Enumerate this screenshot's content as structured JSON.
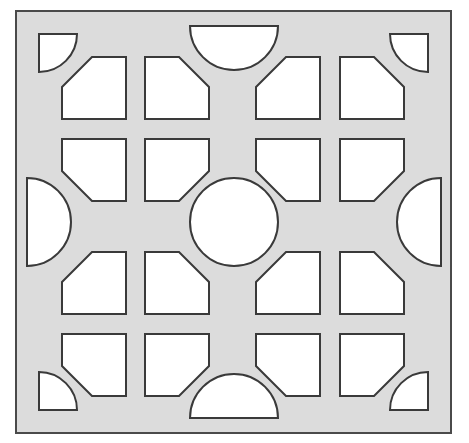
{
  "figure": {
    "name": "decorative-breeze-block-tile",
    "canvas": {
      "width": 469,
      "height": 443
    },
    "colors": {
      "page_background": "#ffffff",
      "tile_fill": "#dcdcdc",
      "opening_fill": "#ffffff",
      "outline": "#3a3a3a",
      "outer_border": "#4a4a4a"
    },
    "stroke_widths": {
      "outer_border": 2.0,
      "opening_outline": 2.0
    }
  },
  "frame": {
    "name": "outer-square-frame",
    "x": 16,
    "y": 11,
    "width": 435,
    "height": 422
  },
  "geometry": {
    "grid": {
      "rows": 4,
      "columns": 4,
      "cell_width": 64,
      "cell_height": 62,
      "corner_cut": 30,
      "columns_x": [
        62,
        145,
        256,
        340
      ],
      "rows_y": [
        57,
        139,
        252,
        334
      ]
    },
    "center_circle": {
      "name": "center-circle-opening",
      "cx": 234,
      "cy": 222,
      "r": 44
    },
    "corner_quarter_circles": [
      {
        "name": "corner-quarter-circle-top-left",
        "cx": 39,
        "cy": 34,
        "r": 38,
        "start_angle": 0,
        "end_angle": 90
      },
      {
        "name": "corner-quarter-circle-top-right",
        "cx": 428,
        "cy": 34,
        "r": 38,
        "start_angle": 90,
        "end_angle": 180
      },
      {
        "name": "corner-quarter-circle-bottom-right",
        "cx": 428,
        "cy": 410,
        "r": 38,
        "start_angle": 180,
        "end_angle": 270
      },
      {
        "name": "corner-quarter-circle-bottom-left",
        "cx": 39,
        "cy": 410,
        "r": 38,
        "start_angle": 270,
        "end_angle": 360
      }
    ],
    "edge_half_circles": [
      {
        "name": "edge-half-circle-top",
        "cx": 234,
        "cy": 26,
        "r": 44,
        "flat_side": "top"
      },
      {
        "name": "edge-half-circle-right",
        "cx": 441,
        "cy": 222,
        "r": 44,
        "flat_side": "right"
      },
      {
        "name": "edge-half-circle-bottom",
        "cx": 234,
        "cy": 418,
        "r": 44,
        "flat_side": "bottom"
      },
      {
        "name": "edge-half-circle-left",
        "cx": 27,
        "cy": 222,
        "r": 44,
        "flat_side": "left"
      }
    ],
    "pentagon_openings": [
      {
        "name": "pentagon-r1c1",
        "row": 1,
        "col": 1,
        "x": 62,
        "y": 57,
        "w": 64,
        "h": 62,
        "cut_corner": "top-left"
      },
      {
        "name": "pentagon-r1c2",
        "row": 1,
        "col": 2,
        "x": 145,
        "y": 57,
        "w": 64,
        "h": 62,
        "cut_corner": "top-right"
      },
      {
        "name": "pentagon-r1c3",
        "row": 1,
        "col": 3,
        "x": 256,
        "y": 57,
        "w": 64,
        "h": 62,
        "cut_corner": "top-left"
      },
      {
        "name": "pentagon-r1c4",
        "row": 1,
        "col": 4,
        "x": 340,
        "y": 57,
        "w": 64,
        "h": 62,
        "cut_corner": "top-right"
      },
      {
        "name": "pentagon-r2c1",
        "row": 2,
        "col": 1,
        "x": 62,
        "y": 139,
        "w": 64,
        "h": 62,
        "cut_corner": "bottom-left"
      },
      {
        "name": "pentagon-r2c2",
        "row": 2,
        "col": 2,
        "x": 145,
        "y": 139,
        "w": 64,
        "h": 62,
        "cut_corner": "bottom-right"
      },
      {
        "name": "pentagon-r2c3",
        "row": 2,
        "col": 3,
        "x": 256,
        "y": 139,
        "w": 64,
        "h": 62,
        "cut_corner": "bottom-left"
      },
      {
        "name": "pentagon-r2c4",
        "row": 2,
        "col": 4,
        "x": 340,
        "y": 139,
        "w": 64,
        "h": 62,
        "cut_corner": "bottom-right"
      },
      {
        "name": "pentagon-r3c1",
        "row": 3,
        "col": 1,
        "x": 62,
        "y": 252,
        "w": 64,
        "h": 62,
        "cut_corner": "top-left"
      },
      {
        "name": "pentagon-r3c2",
        "row": 3,
        "col": 2,
        "x": 145,
        "y": 252,
        "w": 64,
        "h": 62,
        "cut_corner": "top-right"
      },
      {
        "name": "pentagon-r3c3",
        "row": 3,
        "col": 3,
        "x": 256,
        "y": 252,
        "w": 64,
        "h": 62,
        "cut_corner": "top-left"
      },
      {
        "name": "pentagon-r3c4",
        "row": 3,
        "col": 4,
        "x": 340,
        "y": 252,
        "w": 64,
        "h": 62,
        "cut_corner": "top-right"
      },
      {
        "name": "pentagon-r4c1",
        "row": 4,
        "col": 1,
        "x": 62,
        "y": 334,
        "w": 64,
        "h": 62,
        "cut_corner": "bottom-left"
      },
      {
        "name": "pentagon-r4c2",
        "row": 4,
        "col": 2,
        "x": 145,
        "y": 334,
        "w": 64,
        "h": 62,
        "cut_corner": "bottom-right"
      },
      {
        "name": "pentagon-r4c3",
        "row": 4,
        "col": 3,
        "x": 256,
        "y": 334,
        "w": 64,
        "h": 62,
        "cut_corner": "bottom-left"
      },
      {
        "name": "pentagon-r4c4",
        "row": 4,
        "col": 4,
        "x": 340,
        "y": 334,
        "w": 64,
        "h": 62,
        "cut_corner": "bottom-right"
      }
    ]
  }
}
